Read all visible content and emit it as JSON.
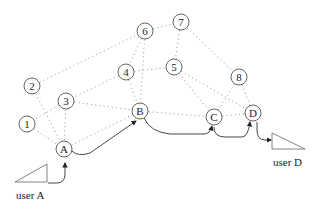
{
  "diagram": {
    "type": "network-routing",
    "nodes": [
      {
        "id": "6",
        "label": "6",
        "x": 145,
        "y": 31
      },
      {
        "id": "7",
        "label": "7",
        "x": 181,
        "y": 22
      },
      {
        "id": "2",
        "label": "2",
        "x": 32,
        "y": 86
      },
      {
        "id": "4",
        "label": "4",
        "x": 126,
        "y": 72
      },
      {
        "id": "5",
        "label": "5",
        "x": 174,
        "y": 67
      },
      {
        "id": "8",
        "label": "8",
        "x": 239,
        "y": 77
      },
      {
        "id": "3",
        "label": "3",
        "x": 66,
        "y": 101
      },
      {
        "id": "1",
        "label": "1",
        "x": 27,
        "y": 124
      },
      {
        "id": "B",
        "label": "B",
        "x": 140,
        "y": 111
      },
      {
        "id": "C",
        "label": "C",
        "x": 214,
        "y": 117
      },
      {
        "id": "D",
        "label": "D",
        "x": 253,
        "y": 113
      },
      {
        "id": "A",
        "label": "A",
        "x": 64,
        "y": 149
      }
    ],
    "links": [
      [
        "2",
        "6"
      ],
      [
        "6",
        "7"
      ],
      [
        "6",
        "4"
      ],
      [
        "6",
        "B"
      ],
      [
        "7",
        "5"
      ],
      [
        "7",
        "8"
      ],
      [
        "4",
        "B"
      ],
      [
        "4",
        "3"
      ],
      [
        "4",
        "5"
      ],
      [
        "5",
        "C"
      ],
      [
        "5",
        "D"
      ],
      [
        "8",
        "C"
      ],
      [
        "8",
        "D"
      ],
      [
        "2",
        "A"
      ],
      [
        "3",
        "1"
      ],
      [
        "3",
        "B"
      ],
      [
        "3",
        "A"
      ],
      [
        "1",
        "A"
      ],
      [
        "A",
        "B"
      ],
      [
        "B",
        "C"
      ],
      [
        "C",
        "D"
      ]
    ],
    "route": [
      "user A",
      "A",
      "B",
      "C",
      "D",
      "user D"
    ],
    "users": [
      {
        "id": "userA",
        "label": "user A"
      },
      {
        "id": "userD",
        "label": "user D"
      }
    ]
  }
}
